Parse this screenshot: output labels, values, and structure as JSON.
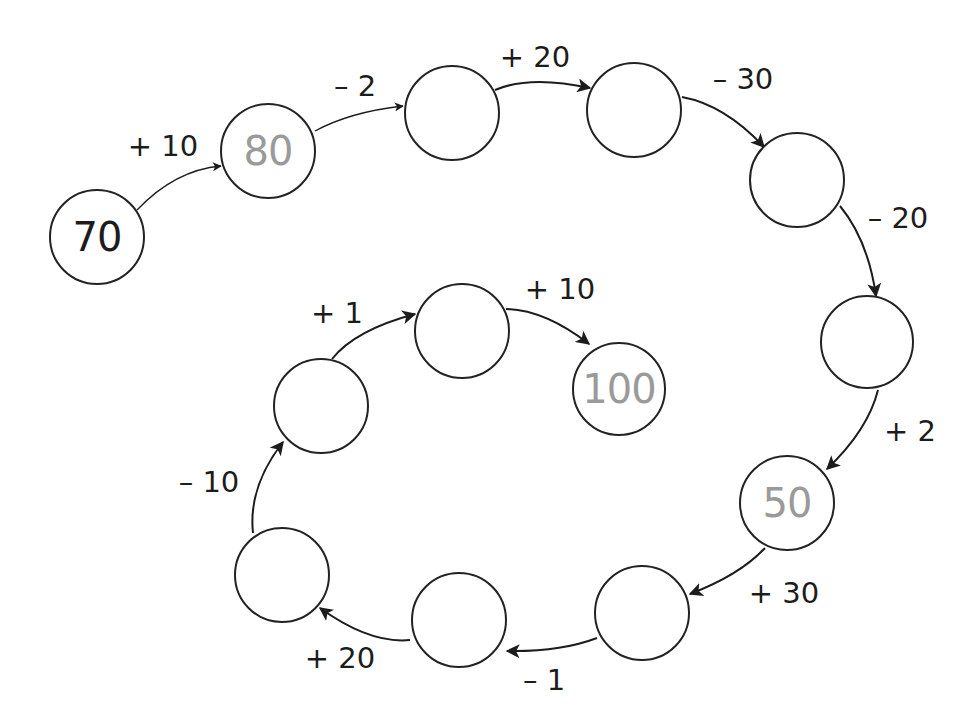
{
  "diagram": {
    "type": "number-chain",
    "nodes": [
      {
        "id": 0,
        "value": "70",
        "style": "given",
        "cx": 97,
        "cy": 237,
        "r": 48
      },
      {
        "id": 1,
        "value": "80",
        "style": "answer",
        "cx": 268,
        "cy": 151,
        "r": 48
      },
      {
        "id": 2,
        "value": "",
        "style": "blank",
        "cx": 452,
        "cy": 113,
        "r": 48
      },
      {
        "id": 3,
        "value": "",
        "style": "blank",
        "cx": 634,
        "cy": 110,
        "r": 48
      },
      {
        "id": 4,
        "value": "",
        "style": "blank",
        "cx": 797,
        "cy": 180,
        "r": 48
      },
      {
        "id": 5,
        "value": "",
        "style": "blank",
        "cx": 867,
        "cy": 342,
        "r": 47
      },
      {
        "id": 6,
        "value": "50",
        "style": "answer",
        "cx": 787,
        "cy": 503,
        "r": 48
      },
      {
        "id": 7,
        "value": "",
        "style": "blank",
        "cx": 642,
        "cy": 613,
        "r": 48
      },
      {
        "id": 8,
        "value": "",
        "style": "blank",
        "cx": 459,
        "cy": 620,
        "r": 48
      },
      {
        "id": 9,
        "value": "",
        "style": "blank",
        "cx": 282,
        "cy": 575,
        "r": 48
      },
      {
        "id": 10,
        "value": "",
        "style": "blank",
        "cx": 321,
        "cy": 406,
        "r": 48
      },
      {
        "id": 11,
        "value": "",
        "style": "blank",
        "cx": 462,
        "cy": 331,
        "r": 48
      },
      {
        "id": 12,
        "value": "100",
        "style": "answer",
        "cx": 619,
        "cy": 389,
        "r": 47
      }
    ],
    "edges": [
      {
        "from": 0,
        "to": 1,
        "label": "+ 10",
        "lx": 163,
        "ly": 146,
        "path": "M137,210 Q175,170 221,166"
      },
      {
        "from": 1,
        "to": 2,
        "label": "– 2",
        "lx": 355,
        "ly": 86,
        "path": "M315,131 Q350,112 403,106"
      },
      {
        "from": 2,
        "to": 3,
        "label": "+ 20",
        "lx": 535,
        "ly": 57,
        "path": "M495,90 Q530,75 590,88"
      },
      {
        "from": 3,
        "to": 4,
        "label": "– 30",
        "lx": 743,
        "ly": 79,
        "path": "M682,97 Q725,105 764,147"
      },
      {
        "from": 4,
        "to": 5,
        "label": "– 20",
        "lx": 898,
        "ly": 218,
        "path": "M840,206 Q868,240 876,296"
      },
      {
        "from": 5,
        "to": 6,
        "label": "+ 2",
        "lx": 910,
        "ly": 431,
        "path": "M878,390 Q868,430 827,469"
      },
      {
        "from": 6,
        "to": 7,
        "label": "+ 30",
        "lx": 784,
        "ly": 593,
        "path": "M765,548 Q740,575 690,594"
      },
      {
        "from": 7,
        "to": 8,
        "label": "– 1",
        "lx": 544,
        "ly": 680,
        "path": "M597,638 Q560,652 507,651"
      },
      {
        "from": 8,
        "to": 9,
        "label": "+ 20",
        "lx": 340,
        "ly": 658,
        "path": "M410,640 Q370,644 320,608"
      },
      {
        "from": 9,
        "to": 10,
        "label": "– 10",
        "lx": 209,
        "ly": 482,
        "path": "M253,533 Q248,487 283,442"
      },
      {
        "from": 10,
        "to": 11,
        "label": "+ 1",
        "lx": 337,
        "ly": 313,
        "path": "M332,359 Q355,330 415,314"
      },
      {
        "from": 11,
        "to": 12,
        "label": "+ 10",
        "lx": 560,
        "ly": 289,
        "path": "M506,309 Q545,310 589,344"
      }
    ]
  }
}
